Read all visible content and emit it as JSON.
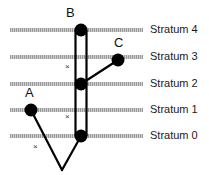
{
  "figure": {
    "background_color": "#ffffff",
    "band_color": "#a8a8a8",
    "line_color": "#000000",
    "node_color": "#000000",
    "width": 209,
    "height": 175
  },
  "strata": [
    {
      "label": "Stratum 4",
      "level": 4,
      "y": 30,
      "label_x": 150,
      "label_y": 25
    },
    {
      "label": "Stratum 3",
      "level": 3,
      "y": 57,
      "label_x": 150,
      "label_y": 52
    },
    {
      "label": "Stratum 2",
      "level": 2,
      "y": 84,
      "label_x": 150,
      "label_y": 79
    },
    {
      "label": "Stratum 1",
      "level": 1,
      "y": 110,
      "label_x": 150,
      "label_y": 105
    },
    {
      "label": "Stratum 0",
      "level": 0,
      "y": 136,
      "label_x": 150,
      "label_y": 131
    }
  ],
  "band_extent": {
    "x_start": 10,
    "x_end": 143,
    "thickness": 4
  },
  "lineage_bar": {
    "name": "B",
    "x_left": 75,
    "x_right": 87,
    "y_top": 30,
    "y_bottom": 136,
    "stroke_width": 2.2
  },
  "nodes": [
    {
      "id": "B",
      "label": "B",
      "cx": 81,
      "cy": 30,
      "r": 6.5,
      "label_x": 68,
      "label_y": 8
    },
    {
      "id": "N2",
      "label": "",
      "cx": 81,
      "cy": 84,
      "r": 6.5,
      "label_x": 0,
      "label_y": 0
    },
    {
      "id": "N0",
      "label": "",
      "cx": 81,
      "cy": 136,
      "r": 6.5,
      "label_x": 0,
      "label_y": 0
    },
    {
      "id": "C",
      "label": "C",
      "cx": 118,
      "cy": 60,
      "r": 6.5,
      "label_x": 118,
      "label_y": 38
    },
    {
      "id": "A",
      "label": "A",
      "cx": 31,
      "cy": 110,
      "r": 6.5,
      "label_x": 27,
      "label_y": 88
    }
  ],
  "branches": [
    {
      "from": "N2",
      "to": "C",
      "x1": 81,
      "y1": 84,
      "x2": 118,
      "y2": 60
    },
    {
      "from": "A",
      "to": "root",
      "x1": 31,
      "y1": 110,
      "x2": 62,
      "y2": 170
    },
    {
      "from": "N0",
      "to": "root",
      "x1": 81,
      "y1": 136,
      "x2": 62,
      "y2": 170
    }
  ],
  "extinction_marks": [
    {
      "name": "extinction-mark-upper",
      "glyph": "×",
      "x": 66,
      "y": 64
    },
    {
      "name": "extinction-mark-lower",
      "glyph": "×",
      "x": 66,
      "y": 114
    },
    {
      "name": "extinction-mark-branch",
      "glyph": "×",
      "x": 34,
      "y": 144
    }
  ]
}
